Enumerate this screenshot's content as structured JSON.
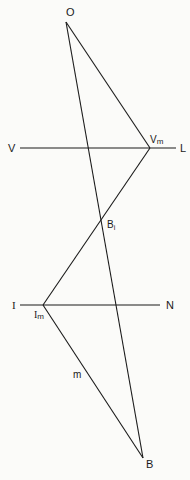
{
  "diagram": {
    "type": "geometric-construction",
    "points": {
      "O": {
        "label": "O",
        "x": 66,
        "y": 22,
        "label_x": 68,
        "label_y": 16
      },
      "Vm": {
        "label": "V",
        "sub": "m",
        "x": 150,
        "y": 148,
        "label_x": 150,
        "label_y": 143
      },
      "Bi": {
        "label": "B",
        "sub": "i",
        "x": 102,
        "y": 221,
        "label_x": 107,
        "label_y": 229
      },
      "Im": {
        "label": "I",
        "sub": "m",
        "x": 43,
        "y": 305,
        "label_x": 35,
        "label_y": 318
      },
      "B": {
        "label": "B",
        "x": 143,
        "y": 458,
        "label_x": 146,
        "label_y": 468
      }
    },
    "lines": {
      "VL": {
        "start_label": "V",
        "end_label": "L",
        "y": 148,
        "x1": 20,
        "x2": 176
      },
      "IN": {
        "start_label": "I",
        "end_label": "N",
        "y": 305,
        "x1": 20,
        "x2": 160
      }
    },
    "segment_labels": {
      "m": "m"
    },
    "labels": {
      "O": "O",
      "V": "V",
      "L": "L",
      "Vm_main": "V",
      "Vm_sub": "m",
      "Bi_main": "B",
      "Bi_sub": "i",
      "I": "I",
      "N": "N",
      "Im_main": "I",
      "Im_sub": "m",
      "m": "m",
      "B": "B"
    },
    "colors": {
      "ink": "#1a1a1a",
      "paper": "#fbfbf9"
    }
  }
}
